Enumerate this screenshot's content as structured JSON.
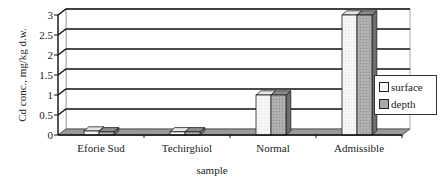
{
  "chart_data": {
    "type": "bar",
    "style": "3d-clustered-column",
    "title": "",
    "xlabel": "sample",
    "ylabel": "Cd conc., mg/kg d.w.",
    "categories": [
      "Eforie Sud",
      "Techirghiol",
      "Normal",
      "Admissible"
    ],
    "series": [
      {
        "name": "surface",
        "values": [
          0.1,
          0.08,
          1,
          3
        ],
        "color": "#f4f4f4"
      },
      {
        "name": "depth",
        "values": [
          0.08,
          0.08,
          1,
          3
        ],
        "color": "#a8a8a8"
      }
    ],
    "ylim": [
      0,
      3
    ],
    "yticks": [
      "0",
      "0.5",
      "1",
      "1.5",
      "2",
      "2.5",
      "3"
    ],
    "grid": true,
    "legend_position": "right"
  },
  "legend": {
    "items": [
      {
        "label": "surface",
        "color": "#f4f4f4"
      },
      {
        "label": "depth",
        "color": "#a8a8a8"
      }
    ]
  }
}
